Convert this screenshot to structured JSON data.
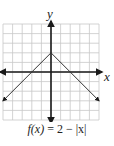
{
  "chart_data": {
    "type": "line",
    "title": "",
    "caption": "f(x) = 2 − |x|",
    "xlabel": "x",
    "ylabel": "y",
    "xlim": [
      -5,
      5
    ],
    "ylim": [
      -5,
      5
    ],
    "grid": true,
    "grid_step": 1,
    "axes_arrows": true,
    "series": [
      {
        "name": "f(x) = 2 − |x|",
        "x": [
          -5,
          0,
          5
        ],
        "y": [
          -3,
          2,
          -3
        ],
        "arrows_at_ends": true
      }
    ],
    "colors": {
      "grid": "#c8c8c8",
      "axes": "#1a1a1a",
      "line": "#333333"
    }
  },
  "labels": {
    "x_axis": "x",
    "y_axis": "y",
    "caption_fx": "f(x)",
    "caption_rest": " = 2 − |x|"
  }
}
